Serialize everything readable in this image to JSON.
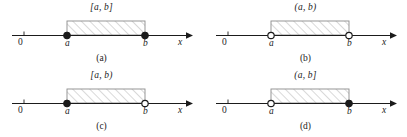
{
  "figure": {
    "type": "interval-diagrams",
    "axis_origin_label": "0",
    "axis_variable_label": "x",
    "left_endpoint_label": "a",
    "right_endpoint_label": "b",
    "hatch_color": "#b9b9b9",
    "line_color": "#1b1b1b",
    "box_border_color": "#8c8c8c",
    "background_color": "#ffffff"
  },
  "panels": [
    {
      "caption": "(a)",
      "interval_label": "[a, b]",
      "interval_kind": "closed",
      "left_endpoint": {
        "label": "a",
        "marker": "filled"
      },
      "right_endpoint": {
        "label": "b",
        "marker": "filled"
      },
      "axis": {
        "origin": "0",
        "variable": "x"
      }
    },
    {
      "caption": "(b)",
      "interval_label": "(a, b)",
      "interval_kind": "open",
      "left_endpoint": {
        "label": "a",
        "marker": "hollow"
      },
      "right_endpoint": {
        "label": "b",
        "marker": "hollow"
      },
      "axis": {
        "origin": "0",
        "variable": "x"
      }
    },
    {
      "caption": "(c)",
      "interval_label": "[a, b)",
      "interval_kind": "half-open-right",
      "left_endpoint": {
        "label": "a",
        "marker": "filled"
      },
      "right_endpoint": {
        "label": "b",
        "marker": "hollow"
      },
      "axis": {
        "origin": "0",
        "variable": "x"
      }
    },
    {
      "caption": "(d)",
      "interval_label": "(a, b]",
      "interval_kind": "half-open-left",
      "left_endpoint": {
        "label": "a",
        "marker": "hollow"
      },
      "right_endpoint": {
        "label": "b",
        "marker": "filled"
      },
      "axis": {
        "origin": "0",
        "variable": "x"
      }
    }
  ]
}
